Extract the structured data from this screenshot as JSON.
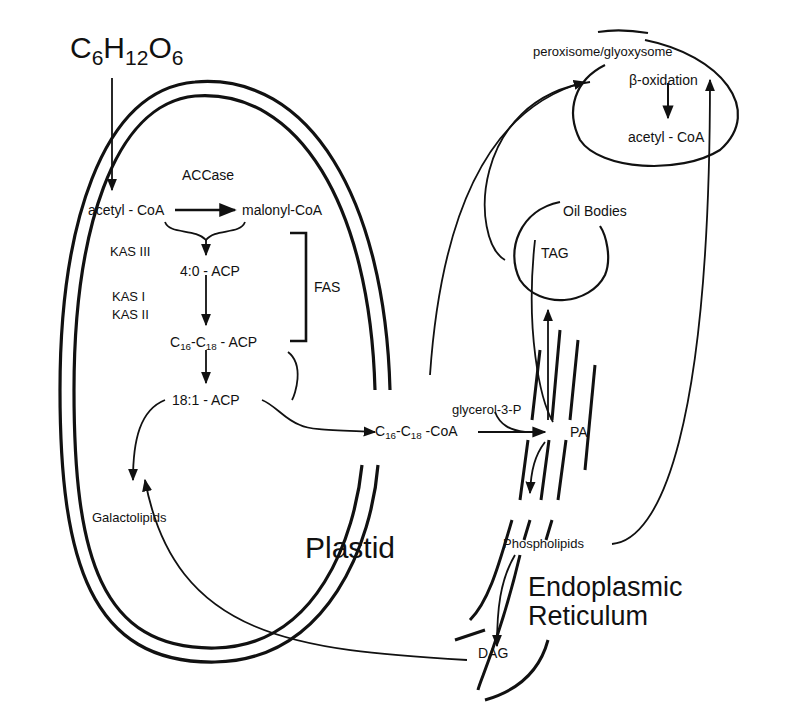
{
  "diagram": {
    "compartments": {
      "plastid": "Plastid",
      "er_line1": "Endoplasmic",
      "er_line2": "Reticulum",
      "peroxisome": "peroxisome/glyoxysome",
      "oil_bodies": "Oil Bodies"
    },
    "glucose": {
      "c": "C",
      "c_sub": "6",
      "h": "H",
      "h_sub": "12",
      "o": "O",
      "o_sub": "6"
    },
    "nodes": {
      "acetyl_coa": "acetyl - CoA",
      "accase": "ACCase",
      "malonyl_coa": "malonyl-CoA",
      "kas3": "KAS III",
      "acp_4_0": "4:0 - ACP",
      "kas1": "KAS I",
      "kas2": "KAS II",
      "fas": "FAS",
      "c16c18_acp": {
        "c1": "C",
        "s1": "16",
        "dash": "-C",
        "s2": "18",
        "rest": " - ACP"
      },
      "acp_18_1": "18:1 - ACP",
      "galactolipids": "Galactolipids",
      "c16c18_coa": {
        "c1": "C",
        "s1": "16",
        "dash": "-C",
        "s2": "18",
        "rest": " -CoA"
      },
      "glycerol_3_p": "glycerol-3-P",
      "pa": "PA",
      "phospholipids": "Phospholipids",
      "dag": "DAG",
      "tag": "TAG",
      "beta_oxidation": "β-oxidation",
      "perox_acetyl_coa": "acetyl - CoA"
    },
    "colors": {
      "ink": "#111111",
      "background": "#ffffff"
    }
  }
}
